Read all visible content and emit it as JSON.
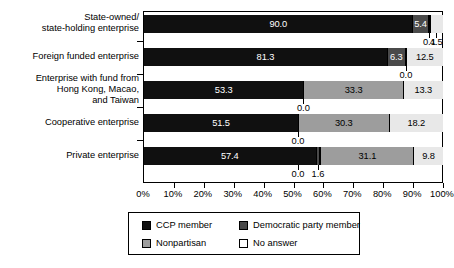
{
  "chart_data": {
    "type": "bar",
    "orientation": "horizontal",
    "stacked": true,
    "stack_mode": "percent",
    "title": "",
    "subtitle": "",
    "xlabel": "",
    "ylabel": "",
    "xlim": [
      0,
      100
    ],
    "grid": false,
    "legend_position": "bottom",
    "categories": [
      "State-owned/\nstate-holding enterprise",
      "Foreign funded enterprise",
      "Enterprise with fund from\nHong Kong, Macao,\nand Taiwan",
      "Cooperative enterprise",
      "Private enterprise"
    ],
    "series": [
      {
        "name": "CCP member",
        "values": [
          90.0,
          81.3,
          53.3,
          51.5,
          57.4
        ]
      },
      {
        "name": "Democratic party member",
        "values": [
          5.4,
          6.3,
          0.0,
          0.0,
          1.6
        ]
      },
      {
        "name": "Nonpartisan",
        "values": [
          0.1,
          0.0,
          33.3,
          30.3,
          31.1
        ]
      },
      {
        "name": "No answer",
        "values": [
          4.5,
          12.5,
          13.3,
          18.2,
          9.8
        ]
      }
    ],
    "tick_labels": [
      "0%",
      "10%",
      "20%",
      "30%",
      "40%",
      "50%",
      "60%",
      "70%",
      "80%",
      "90%",
      "100%"
    ],
    "tick_values": [
      0,
      10,
      20,
      30,
      40,
      50,
      60,
      70,
      80,
      90,
      100
    ],
    "value_label_format": "one-decimal"
  },
  "legend": {
    "items": [
      {
        "label": "CCP member",
        "color": "#101010"
      },
      {
        "label": "Democratic party member",
        "color": "#4a4a4a"
      },
      {
        "label": "Nonpartisan",
        "color": "#9d9d9d"
      },
      {
        "label": "No answer",
        "color": "#ffffff"
      }
    ]
  },
  "rows": [
    {
      "category": "State-owned/\nstate-holding enterprise",
      "inline": [
        {
          "series": "CCP member",
          "value": "90.0",
          "width": 90.0
        },
        {
          "series": "Democratic party member",
          "value": "5.4",
          "width": 5.4
        },
        {
          "series": "Nonpartisan",
          "value": "",
          "width": 0.1
        },
        {
          "series": "No answer",
          "value": "",
          "width": 4.5
        }
      ],
      "callouts": [
        {
          "value": "0.1",
          "at": 95.45
        },
        {
          "value": "4.5",
          "at": 97.75
        }
      ]
    },
    {
      "category": "Foreign funded enterprise",
      "inline": [
        {
          "series": "CCP member",
          "value": "81.3",
          "width": 81.3
        },
        {
          "series": "Democratic party member",
          "value": "6.3",
          "width": 6.3
        },
        {
          "series": "Nonpartisan",
          "value": "",
          "width": 0.0
        },
        {
          "series": "No answer",
          "value": "12.5",
          "width": 12.5
        }
      ],
      "callouts": [
        {
          "value": "0.0",
          "at": 87.6
        }
      ]
    },
    {
      "category": "Enterprise with fund from\nHong Kong, Macao,\nand Taiwan",
      "inline": [
        {
          "series": "CCP member",
          "value": "53.3",
          "width": 53.3
        },
        {
          "series": "Democratic party member",
          "value": "",
          "width": 0.0
        },
        {
          "series": "Nonpartisan",
          "value": "33.3",
          "width": 33.3
        },
        {
          "series": "No answer",
          "value": "13.3",
          "width": 13.3
        }
      ],
      "callouts": [
        {
          "value": "0.0",
          "at": 53.3
        }
      ]
    },
    {
      "category": "Cooperative enterprise",
      "inline": [
        {
          "series": "CCP member",
          "value": "51.5",
          "width": 51.5
        },
        {
          "series": "Democratic party member",
          "value": "",
          "width": 0.0
        },
        {
          "series": "Nonpartisan",
          "value": "30.3",
          "width": 30.3
        },
        {
          "series": "No answer",
          "value": "18.2",
          "width": 18.2
        }
      ],
      "callouts": [
        {
          "value": "0.0",
          "at": 51.5
        }
      ]
    },
    {
      "category": "Private enterprise",
      "inline": [
        {
          "series": "CCP member",
          "value": "57.4",
          "width": 57.4
        },
        {
          "series": "Democratic party member",
          "value": "",
          "width": 1.6
        },
        {
          "series": "Nonpartisan",
          "value": "31.1",
          "width": 31.1
        },
        {
          "series": "No answer",
          "value": "9.8",
          "width": 9.8
        }
      ],
      "callouts": [
        {
          "value": "0.0",
          "at": 51.5
        },
        {
          "value": "1.6",
          "at": 58.2
        }
      ]
    }
  ]
}
